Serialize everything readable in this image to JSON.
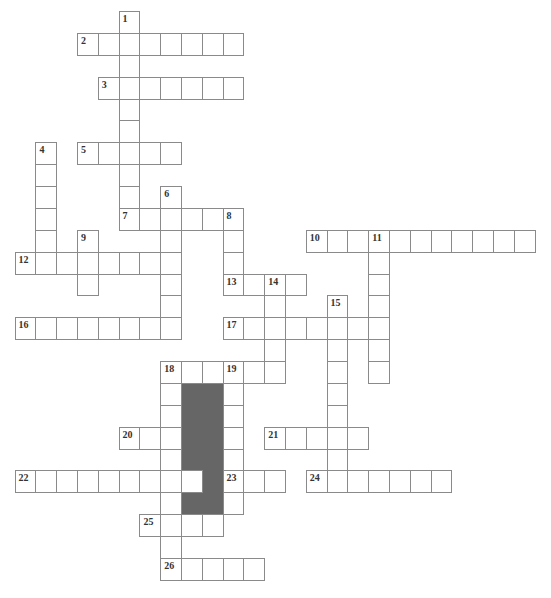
{
  "puzzle": {
    "grid": {
      "origin_x": 14.6,
      "origin_y": 11,
      "cell_w": 20.8,
      "cell_h": 21.88
    },
    "colors": {
      "line": "#8a8a8a",
      "block": "#666666",
      "number": "#333333"
    },
    "entries": [
      {
        "num": "1",
        "dir": "down",
        "row": 0,
        "col": 5,
        "len": 10
      },
      {
        "num": "2",
        "dir": "across",
        "row": 1,
        "col": 3,
        "len": 8
      },
      {
        "num": "3",
        "dir": "across",
        "row": 3,
        "col": 4,
        "len": 7
      },
      {
        "num": "4",
        "dir": "down",
        "row": 6,
        "col": 1,
        "len": 6
      },
      {
        "num": "5",
        "dir": "across",
        "row": 6,
        "col": 3,
        "len": 5
      },
      {
        "num": "6",
        "dir": "down",
        "row": 8,
        "col": 7,
        "len": 7
      },
      {
        "num": "7",
        "dir": "across",
        "row": 9,
        "col": 5,
        "len": 6
      },
      {
        "num": "8",
        "dir": "down",
        "row": 9,
        "col": 10,
        "len": 4
      },
      {
        "num": "9",
        "dir": "down",
        "row": 10,
        "col": 3,
        "len": 3
      },
      {
        "num": "10",
        "dir": "across",
        "row": 10,
        "col": 14,
        "len": 11
      },
      {
        "num": "11",
        "dir": "down",
        "row": 10,
        "col": 17,
        "len": 7
      },
      {
        "num": "12",
        "dir": "across",
        "row": 11,
        "col": 0,
        "len": 8
      },
      {
        "num": "13",
        "dir": "across",
        "row": 12,
        "col": 10,
        "len": 4
      },
      {
        "num": "14",
        "dir": "down",
        "row": 12,
        "col": 12,
        "len": 5
      },
      {
        "num": "15",
        "dir": "down",
        "row": 13,
        "col": 15,
        "len": 9
      },
      {
        "num": "16",
        "dir": "across",
        "row": 14,
        "col": 0,
        "len": 8
      },
      {
        "num": "17",
        "dir": "across",
        "row": 14,
        "col": 10,
        "len": 8
      },
      {
        "num": "18",
        "dir": "across",
        "row": 16,
        "col": 7,
        "len": 6
      },
      {
        "num": "18",
        "dir": "down",
        "row": 16,
        "col": 7,
        "len": 10
      },
      {
        "num": "19",
        "dir": "down",
        "row": 16,
        "col": 10,
        "len": 7
      },
      {
        "num": "20",
        "dir": "across",
        "row": 19,
        "col": 5,
        "len": 3
      },
      {
        "num": "21",
        "dir": "across",
        "row": 19,
        "col": 12,
        "len": 5
      },
      {
        "num": "22",
        "dir": "across",
        "row": 21,
        "col": 0,
        "len": 9
      },
      {
        "num": "23",
        "dir": "across",
        "row": 21,
        "col": 10,
        "len": 3
      },
      {
        "num": "24",
        "dir": "across",
        "row": 21,
        "col": 14,
        "len": 7
      },
      {
        "num": "25",
        "dir": "across",
        "row": 23,
        "col": 6,
        "len": 4
      },
      {
        "num": "26",
        "dir": "across",
        "row": 25,
        "col": 7,
        "len": 5
      }
    ],
    "shaded_block": {
      "row": 17,
      "col": 8,
      "rows": 6,
      "cols": 2
    },
    "block_hole": {
      "row": 21,
      "col": 8
    }
  }
}
